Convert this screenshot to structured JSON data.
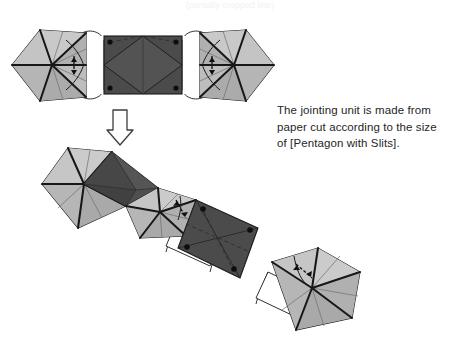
{
  "page": {
    "background_color": "#ffffff",
    "width": 460,
    "height": 344,
    "cropped_header_text": "(partially cropped line)"
  },
  "caption": {
    "lines": [
      "The jointing unit is made from",
      "paper cut according to the size",
      "of [Pentagon with Slits]."
    ],
    "line1": "The jointing unit is made from",
    "line2": "paper cut according to the size",
    "line3": "of [Pentagon with Slits].",
    "text_color": "#262626"
  },
  "colors": {
    "paper_light": "#b9b9b9",
    "paper_light_shade": "#a9a9a9",
    "paper_light_highlight": "#c9c9c9",
    "jointing_dark": "#4b4b4b",
    "jointing_dark_shade": "#414141",
    "jointing_dark_highlight": "#555555",
    "outline": "#1a1a1a",
    "fold_line": "#6b6b6b",
    "tab_white": "#ffffff",
    "arrow_outline": "#3d3d3d",
    "background": "#ffffff"
  },
  "diagram": {
    "title_role": "origami-assembly-instruction",
    "top_figure": {
      "name": "exploded-assembly-row",
      "description": "Two pentagon units with slits flank one dark rectangular jointing unit, linked by white connector tabs.",
      "parts": [
        {
          "id": "pentagon-unit-left",
          "kind": "pentagon-with-slits",
          "fill": "paper_light"
        },
        {
          "id": "tab-left",
          "kind": "connector-tab",
          "fill": "tab_white"
        },
        {
          "id": "jointing-unit-center",
          "kind": "jointing-unit",
          "fill": "jointing_dark"
        },
        {
          "id": "tab-right",
          "kind": "connector-tab",
          "fill": "tab_white"
        },
        {
          "id": "pentagon-unit-right",
          "kind": "pentagon-with-slits",
          "fill": "paper_light"
        }
      ]
    },
    "transform_arrow": {
      "name": "down-arrow",
      "direction": "down",
      "style": "hollow-outline"
    },
    "bottom_figure": {
      "name": "assembled-chain",
      "description": "Assembled diagonal chain running from upper-left to lower-right: pentagon unit, dark jointing diamond, pentagon unit, tab, tilted dark square jointing unit, tab, pentagon unit.",
      "parts": [
        {
          "id": "chain-pentagon-1",
          "kind": "pentagon-with-slits",
          "fill": "paper_light"
        },
        {
          "id": "chain-joint-diamond",
          "kind": "jointing-unit",
          "fill": "jointing_dark"
        },
        {
          "id": "chain-pentagon-2",
          "kind": "pentagon-with-slits",
          "fill": "paper_light"
        },
        {
          "id": "chain-tab-1",
          "kind": "connector-tab",
          "fill": "tab_white"
        },
        {
          "id": "chain-joint-square",
          "kind": "jointing-unit",
          "fill": "jointing_dark"
        },
        {
          "id": "chain-tab-2",
          "kind": "connector-tab",
          "fill": "tab_white"
        },
        {
          "id": "chain-pentagon-3",
          "kind": "pentagon-with-slits",
          "fill": "paper_light"
        }
      ]
    },
    "slit_markers": {
      "name": "insertion-arrow",
      "count": 5,
      "description": "Small double-headed arrows marking where a slit receives the tab."
    },
    "corner_dots": {
      "name": "corner-dot",
      "count": 8,
      "description": "Small black dots at the corners of each dark jointing unit."
    }
  }
}
